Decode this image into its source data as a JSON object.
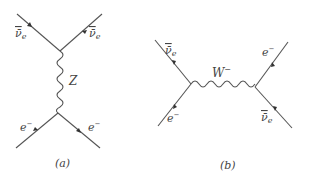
{
  "diagrams": [
    {
      "id": "a",
      "caption": "(a)",
      "boson": "Z",
      "process": "t-channel neutral current",
      "particles": {
        "top_left": "ν̄",
        "top_left_sub": "e",
        "top_right": "ν̄",
        "top_right_sub": "e",
        "bottom_left": "e",
        "bottom_left_sup": "−",
        "bottom_right": "e",
        "bottom_right_sup": "−"
      }
    },
    {
      "id": "b",
      "caption": "(b)",
      "boson": "W",
      "boson_sup": "−",
      "process": "s-channel charged current",
      "particles": {
        "top_left": "ν̄",
        "top_left_sub": "e",
        "bottom_left": "e",
        "bottom_left_sup": "−",
        "top_right": "e",
        "top_right_sup": "−",
        "bottom_right": "ν̄",
        "bottom_right_sub": "e"
      }
    }
  ],
  "colors": {
    "line": "#555555",
    "text": "#444444",
    "background": "#ffffff"
  }
}
